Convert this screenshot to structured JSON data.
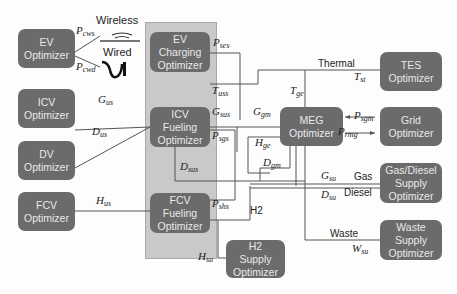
{
  "diagram": {
    "boxes": {
      "ev": [
        "EV",
        "Optimizer"
      ],
      "icv": [
        "ICV",
        "Optimizer"
      ],
      "dv": [
        "DV",
        "Optimizer"
      ],
      "fcv": [
        "FCV",
        "Optimizer"
      ],
      "ev_charging": [
        "EV",
        "Charging",
        "Optimizer"
      ],
      "icv_fueling": [
        "ICV",
        "Fueling",
        "Optimizer"
      ],
      "fcv_fueling": [
        "FCV",
        "Fueling",
        "Optimizer"
      ],
      "meg": [
        "MEG",
        "Optimizer"
      ],
      "tes": [
        "TES",
        "Optimizer"
      ],
      "grid": [
        "Grid",
        "Optimizer"
      ],
      "gas_diesel": [
        "Gas/Diesel",
        "Supply",
        "Optimizer"
      ],
      "waste": [
        "Waste",
        "Supply",
        "Optimizer"
      ],
      "h2": [
        "H2",
        "Supply",
        "Optimizer"
      ]
    },
    "charging_modes": {
      "wireless": "Wireless",
      "wired": "Wired"
    },
    "flow_labels": {
      "p_cws": {
        "base": "P",
        "sub": "cws"
      },
      "p_cwd": {
        "base": "P",
        "sub": "cwd"
      },
      "g_us": {
        "base": "G",
        "sub": "us"
      },
      "d_us": {
        "base": "D",
        "sub": "us"
      },
      "h_us": {
        "base": "H",
        "sub": "us"
      },
      "p_ses": {
        "base": "P",
        "sub": "ses"
      },
      "t_uss": {
        "base": "T",
        "sub": "uss"
      },
      "g_sus": {
        "base": "G",
        "sub": "sus"
      },
      "p_sgs": {
        "base": "P",
        "sub": "sgs"
      },
      "d_sus": {
        "base": "D",
        "sub": "sus"
      },
      "p_shs": {
        "base": "P",
        "sub": "shs"
      },
      "g_gm": {
        "base": "G",
        "sub": "gm"
      },
      "h_ge": {
        "base": "H",
        "sub": "ge"
      },
      "d_gm": {
        "base": "D",
        "sub": "gm"
      },
      "t_ge": {
        "base": "T",
        "sub": "ge"
      },
      "t_st": {
        "base": "T",
        "sub": "st"
      },
      "p_sgm": {
        "base": "P",
        "sub": "sgm"
      },
      "p_rmg": {
        "base": "P",
        "sub": "rmg"
      },
      "g_su": {
        "base": "G",
        "sub": "su"
      },
      "d_su": {
        "base": "D",
        "sub": "su"
      },
      "w_su": {
        "base": "W",
        "sub": "su"
      },
      "h_su": {
        "base": "H",
        "sub": "su"
      }
    },
    "carrier_tags": {
      "thermal": "Thermal",
      "gas": "Gas",
      "diesel": "Diesel",
      "waste": "Waste",
      "h2": "H2"
    },
    "colors": {
      "box_fill": "#6b6b6b",
      "box_text": "#e9e9e9",
      "group_fill": "#c9c9c9",
      "line": "#555555"
    }
  }
}
